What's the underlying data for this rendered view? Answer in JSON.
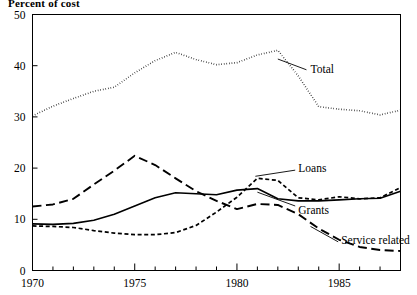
{
  "chart_data": {
    "type": "line",
    "title": "Percent of cost",
    "ylabel": "Percent of cost",
    "xlabel": "",
    "xlim": [
      1970,
      1988
    ],
    "ylim": [
      0,
      50
    ],
    "grid": false,
    "legend_position": "inline-annotations",
    "x": [
      1970,
      1971,
      1972,
      1973,
      1974,
      1975,
      1976,
      1977,
      1978,
      1979,
      1980,
      1981,
      1982,
      1983,
      1984,
      1985,
      1986,
      1987,
      1988
    ],
    "y_ticks": [
      0,
      10,
      20,
      30,
      40,
      50
    ],
    "x_ticks_major": [
      1970,
      1975,
      1980,
      1985
    ],
    "x_tick_labels": [
      "1970",
      "1975",
      "1980",
      "1985"
    ],
    "y_tick_labels": [
      "0",
      "10",
      "20",
      "30",
      "40",
      "50"
    ],
    "series": [
      {
        "name": "Total",
        "style": "dotted",
        "values": [
          30.2,
          32.1,
          33.6,
          35.0,
          35.8,
          38.6,
          41.0,
          42.6,
          41.2,
          40.2,
          40.6,
          42.1,
          43.0,
          38.0,
          32.0,
          31.5,
          31.2,
          30.4,
          31.3
        ]
      },
      {
        "name": "Service related",
        "style": "long-dash",
        "values": [
          12.5,
          12.9,
          14.0,
          16.8,
          19.5,
          22.4,
          20.6,
          18.0,
          15.5,
          13.6,
          12.0,
          13.0,
          12.8,
          11.0,
          8.2,
          6.0,
          4.6,
          4.0,
          3.8
        ]
      },
      {
        "name": "Grants",
        "style": "solid",
        "values": [
          9.1,
          9.0,
          9.2,
          9.8,
          11.0,
          12.6,
          14.2,
          15.2,
          15.0,
          14.8,
          15.7,
          16.0,
          14.0,
          13.6,
          13.6,
          13.8,
          14.0,
          14.1,
          15.5
        ]
      },
      {
        "name": "Loans",
        "style": "short-dash",
        "values": [
          8.7,
          8.6,
          8.4,
          7.8,
          7.3,
          7.0,
          7.0,
          7.4,
          8.8,
          11.4,
          14.3,
          18.0,
          17.6,
          14.2,
          13.8,
          14.4,
          14.0,
          14.2,
          16.2
        ]
      }
    ],
    "annotations": [
      {
        "text": "Total",
        "x": 1983.6,
        "y": 39.4
      },
      {
        "text": "Loans",
        "x": 1983.0,
        "y": 20.0
      },
      {
        "text": "Grants",
        "x": 1983.0,
        "y": 11.9
      },
      {
        "text": "Service related",
        "x": 1985.1,
        "y": 5.9
      }
    ]
  }
}
